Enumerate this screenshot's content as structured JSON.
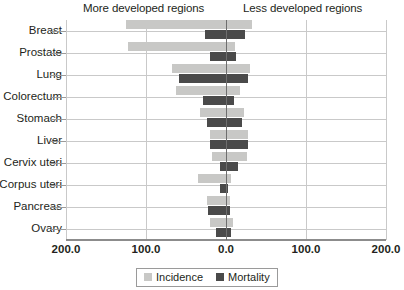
{
  "header": {
    "left_region": "More developed regions",
    "right_region": "Less developed regions"
  },
  "legend": {
    "incidence_label": "Incidence",
    "mortality_label": "Mortality"
  },
  "colors": {
    "incidence": "#c8c8c6",
    "mortality": "#4a4a4a",
    "gridline": "#c9c9c9",
    "zero_line": "#6e6e6e",
    "axis": "#8c8c8c",
    "text": "#231f20"
  },
  "axis": {
    "tick_labels": [
      "200.0",
      "100.0",
      "0.0",
      "100.0",
      "200.0"
    ],
    "tick_values": [
      -200,
      -100,
      0,
      100,
      200
    ],
    "min": -200,
    "max": 200
  },
  "chart_data": {
    "type": "bar",
    "orientation": "horizontal",
    "style": "diverging-bidirectional",
    "title": "",
    "subtitle": "",
    "xlabel": "",
    "ylabel": "",
    "xlim": [
      -200,
      200
    ],
    "grid": true,
    "legend_position": "bottom-center",
    "left_axis_name": "More developed regions",
    "right_axis_name": "Less developed regions",
    "note": "Left-side values are plotted toward 'More developed regions'; right-side values toward 'Less developed regions'. Axis is mirrored so both directions read 0.0 to 200.0.",
    "categories": [
      "Breast",
      "Prostate",
      "Lung",
      "Colorectum",
      "Stomach",
      "Liver",
      "Cervix uteri",
      "Corpus uteri",
      "Pancreas",
      "Ovary"
    ],
    "series": [
      {
        "name": "Incidence",
        "color": "#c8c8c6",
        "more_developed": [
          125,
          122,
          67,
          62,
          33,
          20,
          18,
          35,
          24,
          20
        ],
        "less_developed": [
          33,
          11,
          30,
          17,
          22,
          28,
          26,
          6,
          5,
          9
        ]
      },
      {
        "name": "Mortality",
        "color": "#4a4a4a",
        "more_developed": [
          26,
          20,
          59,
          29,
          24,
          20,
          7,
          8,
          22,
          13
        ],
        "less_developed": [
          24,
          12,
          27,
          10,
          20,
          28,
          15,
          3,
          5,
          6
        ]
      }
    ]
  }
}
